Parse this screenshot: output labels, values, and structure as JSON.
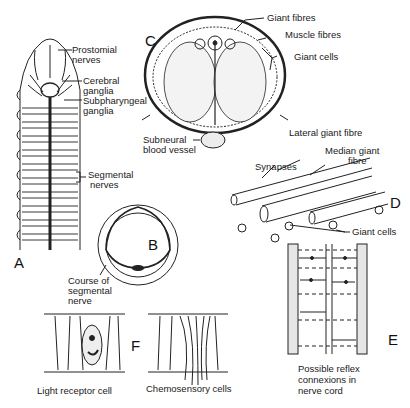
{
  "figure": {
    "panels": {
      "A": {
        "letter": "A",
        "labels": {
          "prostomial_nerves_1": "Prostomial",
          "prostomial_nerves_2": "nerves",
          "cerebral_ganglia_1": "Cerebral",
          "cerebral_ganglia_2": "ganglia",
          "subpharyngeal_ganglia_1": "Subpharyngeal",
          "subpharyngeal_ganglia_2": "ganglia",
          "segmental_nerves_1": "Segmental",
          "segmental_nerves_2": "nerves"
        }
      },
      "B": {
        "letter": "B",
        "labels": {
          "course_1": "Course of",
          "course_2": "segmental",
          "course_3": "nerve"
        }
      },
      "C": {
        "letter": "C",
        "labels": {
          "giant_fibres": "Giant fibres",
          "muscle_fibres": "Muscle fibres",
          "giant_cells": "Giant cells",
          "subneural_1": "Subneural",
          "subneural_2": "blood vessel"
        }
      },
      "D": {
        "letter": "D",
        "labels": {
          "lateral_giant_fibre": "Lateral giant fibre",
          "median_giant_1": "Median giant",
          "median_giant_2": "fibre",
          "synapses": "Synapses",
          "giant_cells": "Giant cells"
        }
      },
      "E": {
        "letter": "E",
        "labels": {
          "reflex_1": "Possible reflex",
          "reflex_2": "connexions in",
          "reflex_3": "nerve cord"
        }
      },
      "F": {
        "letter": "F",
        "labels": {
          "light_receptor": "Light receptor cell",
          "chemosensory": "Chemosensory cells"
        }
      }
    }
  }
}
